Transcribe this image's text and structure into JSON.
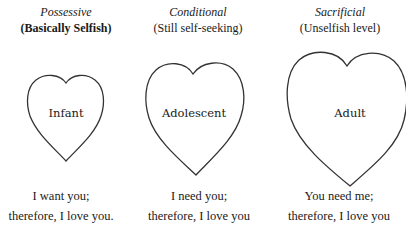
{
  "columns": [
    {
      "category": "Possessive",
      "subtitle": "(Basically Selfish)",
      "stage": "Infant",
      "caption_line1": "I want you;",
      "caption_line2": "therefore, I love you."
    },
    {
      "category": "Conditional",
      "subtitle": "(Still self-seeking)",
      "stage": "Adolescent",
      "caption_line1": "I need you;",
      "caption_line2": "therefore, I love you"
    },
    {
      "category": "Sacrificial",
      "subtitle": "(Unselfish level)",
      "stage": "Adult",
      "caption_line1": "You need me;",
      "caption_line2": "therefore, I love you"
    }
  ],
  "colors": {
    "stroke": "#333333",
    "text": "#1a1a1a",
    "background": "#ffffff"
  }
}
